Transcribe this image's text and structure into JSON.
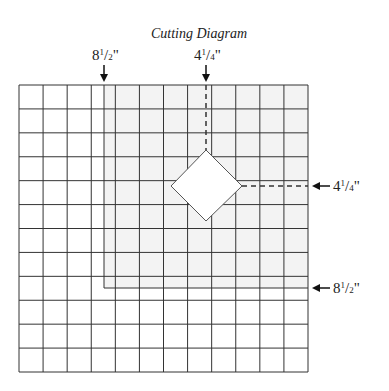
{
  "title": "Cutting Diagram",
  "labels": {
    "top_left": {
      "whole": "8",
      "num": "1",
      "den": "2",
      "unit": "\""
    },
    "top_right": {
      "whole": "4",
      "num": "1",
      "den": "4",
      "unit": "\""
    },
    "right_upper": {
      "whole": "4",
      "num": "1",
      "den": "4",
      "unit": "\""
    },
    "right_lower": {
      "whole": "8",
      "num": "1",
      "den": "2",
      "unit": "\""
    }
  },
  "grid": {
    "columns": 12,
    "rows": 12
  },
  "colors": {
    "line": "#333333",
    "shade": "#f3f3f3",
    "background": "#ffffff"
  }
}
